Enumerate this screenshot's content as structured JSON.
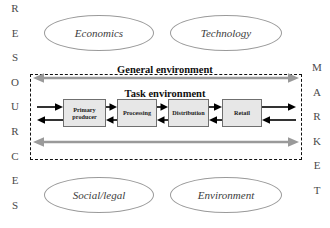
{
  "diagram": {
    "left_axis": {
      "name": "RESOURCES",
      "letters": [
        "R",
        "E",
        "S",
        "O",
        "U",
        "R",
        "C",
        "E",
        "S"
      ]
    },
    "right_axis": {
      "name": "MARKET",
      "letters": [
        "M",
        "A",
        "R",
        "K",
        "E",
        "T"
      ]
    },
    "environments": {
      "general_label": "General environment",
      "task_label": "Task environment"
    },
    "forces": [
      {
        "label": "Economics"
      },
      {
        "label": "Technology"
      },
      {
        "label": "Social/legal"
      },
      {
        "label": "Environment"
      }
    ],
    "chain": [
      {
        "label": "Primary producer",
        "line1": "Primary",
        "line2": "producer"
      },
      {
        "label": "Processing",
        "line1": "Processing",
        "line2": ""
      },
      {
        "label": "Distribution",
        "line1": "Distribution",
        "line2": ""
      },
      {
        "label": "Retail",
        "line1": "Retail",
        "line2": ""
      }
    ],
    "colors": {
      "box_fill": "#e7e7e7",
      "box_stroke": "#6f6f6f",
      "gray_arrow": "#9a9a9a",
      "flow_arrow": "#000000",
      "boundary": "#111111",
      "ellipse_stroke": "#9a9a9a",
      "letter": "#4a4a4a"
    }
  }
}
